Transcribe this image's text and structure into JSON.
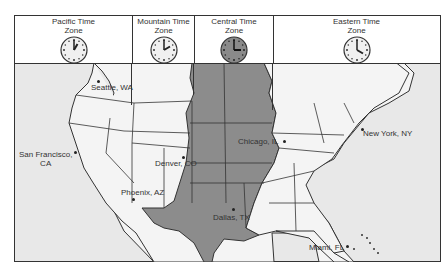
{
  "zones": [
    {
      "label_line1": "Pacific Time",
      "label_line2": "Zone",
      "clock_time": "1:00",
      "hour": 1,
      "face": "#f0f0f0"
    },
    {
      "label_line1": "Mountain Time",
      "label_line2": "Zone",
      "clock_time": "2:00",
      "hour": 2,
      "face": "#f0f0f0"
    },
    {
      "label_line1": "Central Time",
      "label_line2": "Zone",
      "clock_time": "3:00",
      "hour": 3,
      "face": "#8a8a8a"
    },
    {
      "label_line1": "Eastern Time",
      "label_line2": "Zone",
      "clock_time": "4:00",
      "hour": 4,
      "face": "#f0f0f0"
    }
  ],
  "cities": [
    {
      "name": "Seattle, WA"
    },
    {
      "name_line1": "San Francisco,",
      "name_line2": "CA"
    },
    {
      "name": "Denver, CO"
    },
    {
      "name": "Phoenix, AZ"
    },
    {
      "name": "Dallas, TX"
    },
    {
      "name": "Chicago, IL"
    },
    {
      "name": "New York, NY"
    },
    {
      "name": "Miami, FL"
    }
  ],
  "colors": {
    "central_zone_fill": "#8c8c8c",
    "other_zone_fill": "#f4f4f4",
    "ocean": "#e6e6e6",
    "border": "#333333"
  }
}
